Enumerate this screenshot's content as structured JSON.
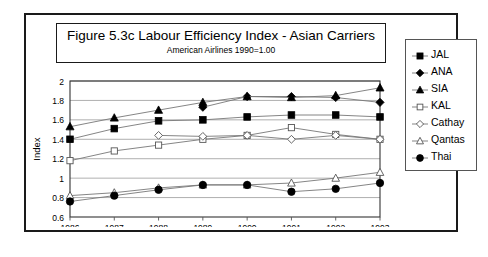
{
  "figure": {
    "title": "Figure 5.3c  Labour Efficiency Index - Asian Carriers",
    "subtitle": "American Airlines 1990=1.00"
  },
  "chart_data": {
    "type": "line",
    "title": "Figure 5.3c  Labour Efficiency Index - Asian Carriers",
    "subtitle": "American Airlines 1990=1.00",
    "xlabel": "Year",
    "ylabel": "Index",
    "categories": [
      "1986",
      "1987",
      "1988",
      "1989",
      "1990",
      "1991",
      "1992",
      "1993"
    ],
    "x": [
      1986,
      1987,
      1988,
      1989,
      1990,
      1991,
      1992,
      1993
    ],
    "xlim": [
      1986,
      1993
    ],
    "ylim": [
      0.6,
      2
    ],
    "yticks": [
      0.6,
      0.8,
      1,
      1.2,
      1.4,
      1.6,
      1.8,
      2
    ],
    "ytick_labels": [
      "0.6",
      "0.8",
      "1",
      "1.2",
      "1.4",
      "1.6",
      "1.8",
      "2"
    ],
    "grid": true,
    "legend_position": "right",
    "series": [
      {
        "name": "JAL",
        "marker": "filled-square",
        "values": [
          1.4,
          1.51,
          1.59,
          1.6,
          1.63,
          1.65,
          1.65,
          1.63
        ]
      },
      {
        "name": "ANA",
        "marker": "filled-diamond",
        "values": [
          null,
          null,
          null,
          1.73,
          1.84,
          1.84,
          1.83,
          1.78
        ]
      },
      {
        "name": "SIA",
        "marker": "filled-triangle",
        "values": [
          1.53,
          1.62,
          1.7,
          1.78,
          1.84,
          1.83,
          1.85,
          1.93
        ]
      },
      {
        "name": "KAL",
        "marker": "open-square",
        "values": [
          1.18,
          1.28,
          1.34,
          1.4,
          1.44,
          1.52,
          1.45,
          1.4
        ]
      },
      {
        "name": "Cathay",
        "marker": "open-diamond",
        "values": [
          null,
          null,
          1.44,
          1.43,
          1.44,
          1.4,
          1.44,
          1.4
        ]
      },
      {
        "name": "Qantas",
        "marker": "open-triangle",
        "values": [
          0.82,
          0.85,
          0.9,
          0.93,
          0.93,
          0.95,
          1.0,
          1.06
        ]
      },
      {
        "name": "Thai",
        "marker": "filled-circle",
        "values": [
          0.76,
          0.82,
          0.88,
          0.93,
          0.93,
          0.86,
          0.89,
          0.95
        ]
      }
    ]
  }
}
